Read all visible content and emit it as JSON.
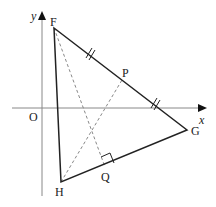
{
  "diagram": {
    "title": "",
    "axes": {
      "x_label": "x",
      "y_label": "y",
      "origin_label": "O",
      "axis_color": "#888888"
    },
    "triangle": {
      "vertices": [
        "F",
        "G",
        "H"
      ],
      "stroke_color": "#222222"
    },
    "points": {
      "F": {
        "label": "F"
      },
      "G": {
        "label": "G"
      },
      "H": {
        "label": "H"
      },
      "P": {
        "label": "P",
        "note": "point on FG (equal tick marks on FP and PG, i.e. midpoint)"
      },
      "Q": {
        "label": "Q",
        "note": "foot of perpendicular from F onto HG (right-angle marker)"
      }
    },
    "dashed_segments": [
      "FQ",
      "HP"
    ],
    "marks": {
      "equal_ticks": [
        "FP",
        "PG"
      ],
      "right_angle_at": "Q"
    },
    "colors": {
      "line": "#222222",
      "dashed": "#888888",
      "axis": "#888888",
      "background": "#ffffff"
    }
  }
}
